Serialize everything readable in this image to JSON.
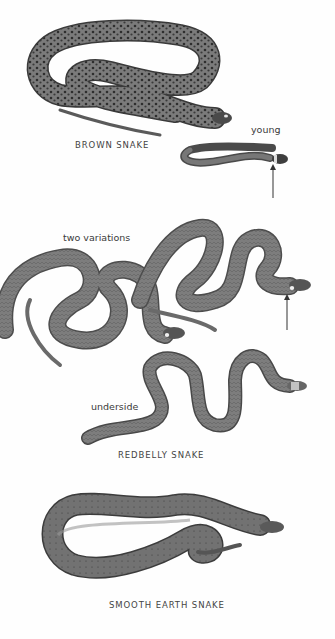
{
  "plate": {
    "background": "#fefefe",
    "snakes": [
      {
        "id": "brown-snake",
        "name": "BROWN SNAKE",
        "annotation": "young",
        "body_color": "#6e6e6e",
        "pattern": "spotted"
      },
      {
        "id": "redbelly-snake",
        "name": "REDBELLY SNAKE",
        "annotations": [
          "two variations",
          "underside"
        ],
        "body_color": "#7a7a7a",
        "pattern": "striped"
      },
      {
        "id": "smooth-earth-snake",
        "name": "SMOOTH EARTH SNAKE",
        "body_color": "#6a6a6a",
        "pattern": "faint-speckled"
      }
    ]
  },
  "labels": {
    "brown_snake": "BROWN SNAKE",
    "young": "young",
    "two_variations": "two variations",
    "underside": "underside",
    "redbelly_snake": "REDBELLY SNAKE",
    "smooth_earth_snake": "SMOOTH EARTH SNAKE"
  }
}
